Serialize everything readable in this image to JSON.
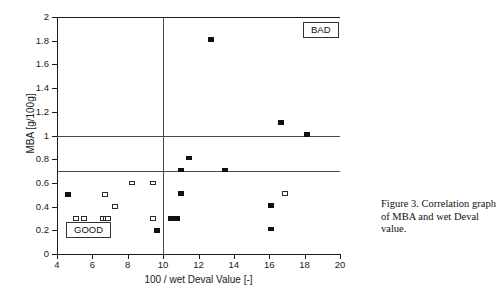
{
  "chart_data": {
    "type": "scatter",
    "title": "",
    "xlabel": "100 / wet Deval Value [-]",
    "ylabel": "MBA [g/100g]",
    "xlim": [
      4,
      20
    ],
    "ylim": [
      0,
      2
    ],
    "xticks": [
      4,
      6,
      8,
      10,
      12,
      14,
      16,
      18,
      20
    ],
    "yticks": [
      0,
      0.2,
      0.4,
      0.6,
      0.8,
      1,
      1.2,
      1.4,
      1.6,
      1.8,
      2
    ],
    "xtick_labels": [
      "4",
      "6",
      "8",
      "10",
      "12",
      "14",
      "16",
      "18",
      "20"
    ],
    "ytick_labels": [
      "0",
      "0.2",
      "0.4",
      "0.6",
      "0.8",
      "1",
      "1.2",
      "1.4",
      "1.6",
      "1.8",
      "2"
    ],
    "grid": false,
    "legend": "none",
    "reference_lines": {
      "horizontal": [
        0.7,
        1.0
      ],
      "vertical": [
        10.0
      ],
      "color": "#4a4a4a"
    },
    "annotations": [
      {
        "text": "BAD",
        "x": 18.6,
        "y": 1.88,
        "boxed": true
      },
      {
        "text": "GOOD",
        "x": 5.3,
        "y": 0.15,
        "boxed": true
      }
    ],
    "series": [
      {
        "name": "filled-square",
        "marker": "filled-square",
        "color": "#111111",
        "points": [
          {
            "x": 4.65,
            "y": 0.5
          },
          {
            "x": 9.65,
            "y": 0.2
          },
          {
            "x": 10.45,
            "y": 0.3
          },
          {
            "x": 10.8,
            "y": 0.3
          },
          {
            "x": 11.0,
            "y": 0.51
          },
          {
            "x": 11.0,
            "y": 0.71
          },
          {
            "x": 11.45,
            "y": 0.81
          },
          {
            "x": 12.7,
            "y": 1.81
          },
          {
            "x": 13.5,
            "y": 0.71
          },
          {
            "x": 16.1,
            "y": 0.41
          },
          {
            "x": 16.1,
            "y": 0.21
          },
          {
            "x": 16.65,
            "y": 1.11
          },
          {
            "x": 18.15,
            "y": 1.01
          }
        ]
      },
      {
        "name": "open-square",
        "marker": "open-square",
        "color": "#2a2a2a",
        "points": [
          {
            "x": 5.05,
            "y": 0.3
          },
          {
            "x": 5.55,
            "y": 0.3
          },
          {
            "x": 6.6,
            "y": 0.3
          },
          {
            "x": 6.75,
            "y": 0.3
          },
          {
            "x": 6.9,
            "y": 0.3
          },
          {
            "x": 6.7,
            "y": 0.5
          },
          {
            "x": 7.3,
            "y": 0.4
          },
          {
            "x": 8.25,
            "y": 0.6
          },
          {
            "x": 9.45,
            "y": 0.6
          },
          {
            "x": 9.45,
            "y": 0.3
          },
          {
            "x": 16.9,
            "y": 0.51
          }
        ]
      }
    ]
  },
  "caption": {
    "text": "Figure 3. Correlation graph of MBA and wet Deval value."
  }
}
